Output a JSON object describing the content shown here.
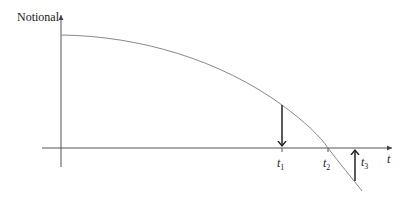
{
  "diagram": {
    "y_axis_label": "Notional",
    "x_axis_label": "t",
    "ticks": [
      {
        "name": "t1",
        "base": "t",
        "sub": "1"
      },
      {
        "name": "t2",
        "base": "t",
        "sub": "2"
      },
      {
        "name": "t3",
        "base": "t",
        "sub": "3"
      }
    ],
    "colors": {
      "axis": "#555555",
      "curve": "#888888",
      "arrow": "#222222",
      "text": "#222222"
    }
  }
}
